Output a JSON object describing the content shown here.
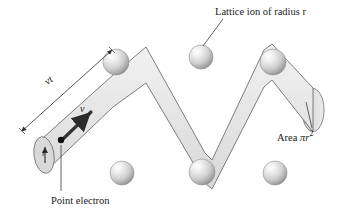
{
  "figure": {
    "background_color": "#ffffff",
    "width": 344,
    "height": 217
  },
  "labels": {
    "lattice_ion": "Lattice ion of radius r",
    "area": "Area",
    "area_symbol": "πr",
    "area_exponent": "2",
    "point_electron": "Point electron",
    "distance": "vt",
    "velocity": "v",
    "radius": "r"
  },
  "colors": {
    "tube_fill": "#e3e3e3",
    "tube_stroke": "#6e6e6e",
    "endcap_fill": "#d2d2d2",
    "sphere_light": "#fdfdfd",
    "sphere_mid": "#c9c9c9",
    "sphere_dark": "#8e8e8e",
    "line": "#3a3a3a",
    "text": "#1a1a1a",
    "arrow": "#2b2b2b"
  },
  "elements": {
    "lattice_ions": [
      {
        "name": "ion-top-left",
        "cx": 116,
        "cy": 62,
        "r": 13
      },
      {
        "name": "ion-top-mid",
        "cx": 201,
        "cy": 57,
        "r": 12
      },
      {
        "name": "ion-top-right",
        "cx": 273,
        "cy": 62,
        "r": 13
      },
      {
        "name": "ion-bottom-left",
        "cx": 122,
        "cy": 173,
        "r": 12
      },
      {
        "name": "ion-bottom-mid",
        "cx": 202,
        "cy": 172,
        "r": 13
      },
      {
        "name": "ion-bottom-right",
        "cx": 275,
        "cy": 173,
        "r": 12
      }
    ],
    "electron_point": {
      "cx": 61,
      "cy": 140,
      "r": 3
    },
    "velocity_arrow": {
      "x1": 61,
      "y1": 140,
      "x2": 92,
      "y2": 111
    },
    "tube_path": "zigzag cylinder from lower-left to right",
    "endcap_right": {
      "cx": 313,
      "cy": 110,
      "rx": 11,
      "ry": 21
    },
    "endcap_left": {
      "cx": 44,
      "cy": 155,
      "rx": 10,
      "ry": 18
    },
    "leader_lines": [
      {
        "name": "leader-lattice-ion",
        "x1": 222,
        "y1": 20,
        "x2": 203,
        "y2": 46
      },
      {
        "name": "leader-area",
        "x1": 312,
        "y1": 128,
        "x2": 307,
        "y2": 104
      },
      {
        "name": "leader-point-electron",
        "x1": 61,
        "y1": 143,
        "x2": 61,
        "y2": 192
      }
    ],
    "dimension_line": {
      "x1": 21,
      "y1": 130,
      "x2": 113,
      "y2": 48,
      "label": "vt"
    },
    "radius_arrow": {
      "x1": 45,
      "y1": 162,
      "x2": 45,
      "y2": 148
    }
  }
}
